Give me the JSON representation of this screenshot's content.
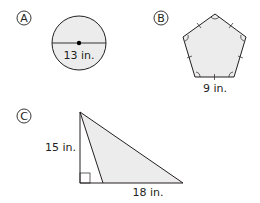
{
  "figures": [
    {
      "id": "A",
      "badge": "A",
      "shape": "circle",
      "measure_label": "13 in.",
      "measure_type": "diameter"
    },
    {
      "id": "B",
      "badge": "B",
      "shape": "regular pentagon",
      "measure_label": "9 in.",
      "measure_type": "side length"
    },
    {
      "id": "C",
      "badge": "C",
      "shape": "triangle",
      "height_label": "15 in.",
      "base_label": "18 in.",
      "measure_type": "height and base"
    }
  ],
  "colors": {
    "stroke": "#231f20",
    "fill": "#ececec",
    "background": "#ffffff"
  }
}
